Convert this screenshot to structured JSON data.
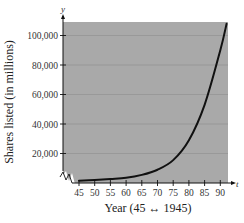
{
  "chart_data": {
    "type": "line",
    "title": "",
    "xlabel": "Year (45 ↔ 1945)",
    "ylabel": "Shares listed (in millions)",
    "x_axis_letter": "t",
    "y_axis_letter": "y",
    "xlim": [
      42,
      92
    ],
    "ylim": [
      0,
      108000
    ],
    "x_ticks": [
      45,
      50,
      55,
      60,
      65,
      70,
      75,
      80,
      85,
      90
    ],
    "x_tick_labels": [
      "45",
      "50",
      "55",
      "60",
      "65",
      "70",
      "75",
      "80",
      "85",
      "90"
    ],
    "y_ticks": [
      20000,
      40000,
      60000,
      80000,
      100000
    ],
    "y_tick_labels": [
      "20,000",
      "40,000",
      "60,000",
      "80,000",
      "100,000"
    ],
    "grid": true,
    "axis_break": true,
    "background": "#a9a9a9",
    "line_color": "#111111",
    "series": [
      {
        "name": "Shares listed",
        "x": [
          45,
          50,
          55,
          60,
          65,
          70,
          75,
          80,
          85,
          90,
          92
        ],
        "values": [
          1500,
          2000,
          2700,
          3500,
          5500,
          9000,
          15500,
          29000,
          53000,
          90000,
          108000
        ]
      }
    ]
  }
}
